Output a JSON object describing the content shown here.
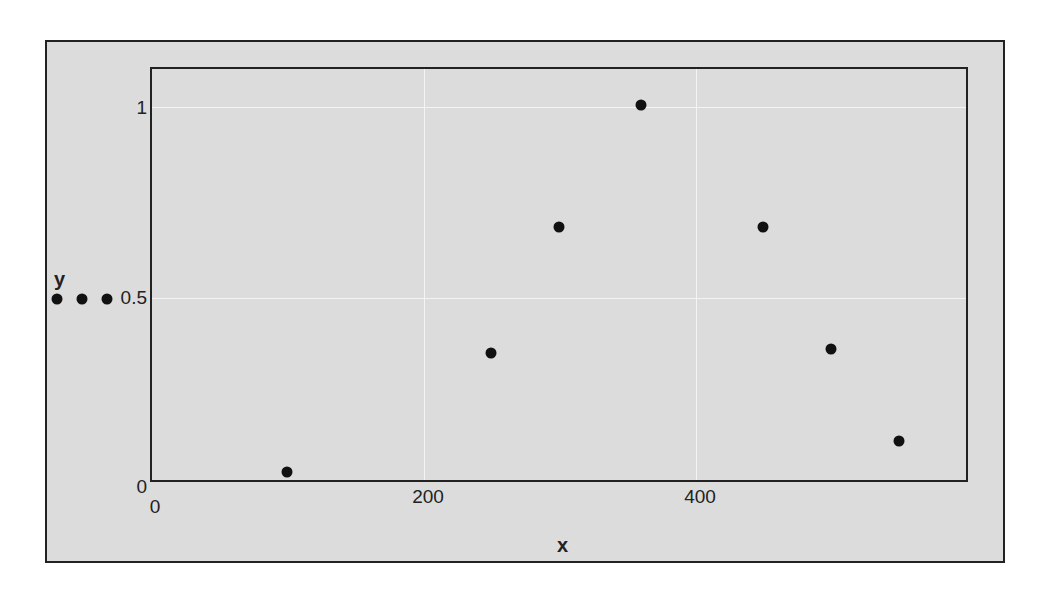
{
  "chart_data": {
    "type": "scatter",
    "title": "",
    "xlabel": "x",
    "ylabel": "y",
    "xlim": [
      0,
      600
    ],
    "ylim": [
      0,
      1.1
    ],
    "x_ticks": [
      "0",
      "200",
      "400"
    ],
    "y_ticks": [
      "0",
      "0.5",
      "1"
    ],
    "grid": true,
    "points": [
      {
        "x": 100,
        "y": 0.04
      },
      {
        "x": 250,
        "y": 0.35
      },
      {
        "x": 300,
        "y": 0.68
      },
      {
        "x": 360,
        "y": 1.0
      },
      {
        "x": 450,
        "y": 0.68
      },
      {
        "x": 500,
        "y": 0.36
      },
      {
        "x": 550,
        "y": 0.12
      }
    ],
    "marker_color": "#111111",
    "background_color": "#dcdcdc"
  },
  "labels": {
    "x_axis": "x",
    "y_axis": "y",
    "x_tick_0": "0",
    "x_tick_200": "200",
    "x_tick_400": "400",
    "y_tick_0": "0",
    "y_tick_05": "0.5",
    "y_tick_1": "1"
  }
}
